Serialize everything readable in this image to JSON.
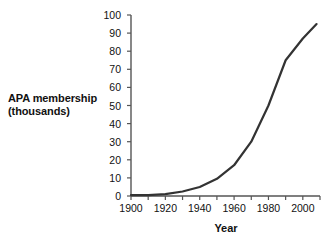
{
  "chart_data": {
    "type": "line",
    "title": "",
    "xlabel": "Year",
    "ylabel": "APA membership (thousands)",
    "ylabel_lines": [
      "APA membership",
      "(thousands)"
    ],
    "xlim": [
      1900,
      2010
    ],
    "ylim": [
      0,
      100
    ],
    "grid": false,
    "legend": false,
    "line_color": "#333333",
    "axis_color": "#555555",
    "text_color": "#111111",
    "x_ticks": [
      1900,
      1910,
      1920,
      1930,
      1940,
      1950,
      1960,
      1970,
      1980,
      1990,
      2000,
      2010
    ],
    "x_tick_labels": [
      "1900",
      "",
      "1920",
      "",
      "1940",
      "",
      "1960",
      "",
      "1980",
      "",
      "2000",
      ""
    ],
    "x_labeled_ticks": [
      {
        "value": 1900,
        "label": "1900"
      },
      {
        "value": 1920,
        "label": "1920"
      },
      {
        "value": 1940,
        "label": "1940"
      },
      {
        "value": 1960,
        "label": "1960"
      },
      {
        "value": 1980,
        "label": "1980"
      },
      {
        "value": 2000,
        "label": "2000"
      }
    ],
    "y_ticks": [
      0,
      10,
      20,
      30,
      40,
      50,
      60,
      70,
      80,
      90,
      100
    ],
    "y_tick_labels": [
      "0",
      "10",
      "20",
      "30",
      "40",
      "50",
      "60",
      "70",
      "80",
      "90",
      "100"
    ],
    "x": [
      1900,
      1910,
      1920,
      1930,
      1940,
      1950,
      1960,
      1970,
      1980,
      1990,
      2000,
      2008
    ],
    "values": [
      0.5,
      0.5,
      1,
      2.5,
      5,
      9.5,
      17,
      30,
      50,
      75,
      87,
      95
    ],
    "series": [
      {
        "name": "APA membership",
        "x": [
          1900,
          1910,
          1920,
          1930,
          1940,
          1950,
          1960,
          1970,
          1980,
          1990,
          2000,
          2008
        ],
        "values": [
          0.5,
          0.5,
          1,
          2.5,
          5,
          9.5,
          17,
          30,
          50,
          75,
          87,
          95
        ]
      }
    ]
  }
}
